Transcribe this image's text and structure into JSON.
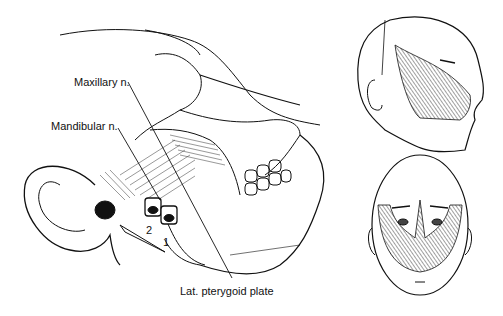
{
  "figure": {
    "type": "anatomical illustration",
    "panels": [
      {
        "name": "lateral-skull",
        "description": "Lateral view of skull with needle approach to trigeminal branches"
      },
      {
        "name": "head-lateral-distribution",
        "description": "Lateral head with hatched sensory distribution area"
      },
      {
        "name": "head-frontal-distribution",
        "description": "Frontal head with hatched sensory distribution area"
      }
    ],
    "labels": {
      "maxillary": "Maxillary n.",
      "mandibular": "Mandibular n.",
      "lat_pterygoid": "Lat. pterygoid plate",
      "needle_1": "1",
      "needle_2": "2"
    },
    "colors": {
      "ink": "#111111",
      "background": "#ffffff"
    }
  }
}
